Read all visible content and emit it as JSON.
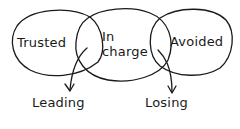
{
  "diagram": {
    "type": "venn",
    "style": "hand-drawn",
    "stroke_color": "#1a1a1a",
    "background": "#ffffff",
    "sets": [
      {
        "id": "trusted",
        "label": "Trusted"
      },
      {
        "id": "in_charge",
        "label": "In charge",
        "label_lines": [
          "In",
          "charge"
        ]
      },
      {
        "id": "avoided",
        "label": "Avoided"
      }
    ],
    "intersections": [
      {
        "between": [
          "trusted",
          "in_charge"
        ],
        "label": "Leading"
      },
      {
        "between": [
          "in_charge",
          "avoided"
        ],
        "label": "Losing"
      }
    ]
  },
  "labels": {
    "trusted": "Trusted",
    "in_line1": "In",
    "in_line2": "charge",
    "avoided": "Avoided",
    "leading": "Leading",
    "losing": "Losing"
  }
}
